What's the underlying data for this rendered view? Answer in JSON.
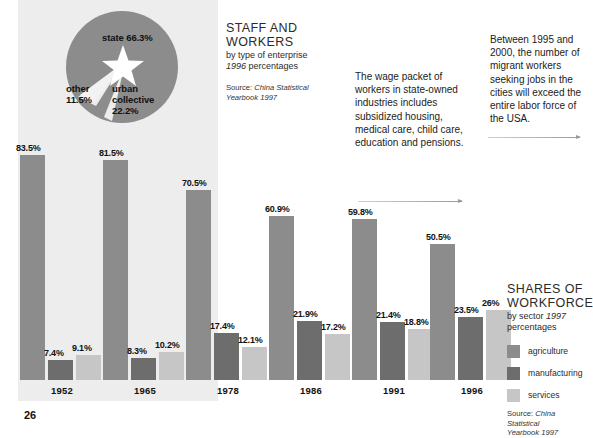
{
  "page_number": "26",
  "colors": {
    "agriculture": "#8c8c8c",
    "manufacturing": "#6d6d6d",
    "services": "#c6c6c6",
    "panel_background": "#ecedec",
    "page_background": "#ffffff"
  },
  "pie": {
    "title": "STAFF AND WORKERS",
    "slices": [
      {
        "label": "state 66.3%",
        "name": "state",
        "value": 66.3
      },
      {
        "label": "urban collective 22.2%",
        "name": "urban collective",
        "value": 22.2
      },
      {
        "label": "other 11.5%",
        "name": "other",
        "value": 11.5
      }
    ],
    "label_state": "state 66.3%",
    "label_other": "other\n11.5%",
    "label_other_line1": "other",
    "label_other_line2": "11.5%",
    "label_urban_line1": "urban",
    "label_urban_line2": "collective",
    "label_urban_line3": "22.2%",
    "center_icon": "star-icon"
  },
  "staff_block": {
    "title_line1": "STAFF AND",
    "title_line2": "WORKERS",
    "subtitle_line1": "by type of enterprise",
    "subtitle_year": "1996",
    "subtitle_line2_rest": " percentages",
    "source_prefix": "Source: ",
    "source_italic": "China Statistical",
    "source_line2": "Yearbook 1997"
  },
  "annotations": {
    "wage": "The wage packet of workers in state-owned industries includes subsidized housing, medical care, child care, education and pensions.",
    "migrant": "Between 1995 and 2000, the number of migrant workers seeking jobs in the cities will exceed the entire labor force of the USA."
  },
  "legend_block": {
    "title_line1": "SHARES OF",
    "title_line2": "WORKFORCE",
    "subtitle_line1": "by sector ",
    "subtitle_year": "1997",
    "subtitle_line2": "percentages",
    "items": [
      {
        "key": "agriculture",
        "label": "agriculture"
      },
      {
        "key": "manufacturing",
        "label": "manufacturing"
      },
      {
        "key": "services",
        "label": "services"
      }
    ],
    "source_prefix": "Source: ",
    "source_italic": "China Statistical",
    "source_line2": "Yearbook 1997"
  },
  "chart_data": {
    "type": "bar",
    "title": "SHARES OF WORKFORCE",
    "subtitle": "by sector 1997 percentages",
    "xlabel": "",
    "ylabel": "percentages",
    "ylim": [
      0,
      100
    ],
    "grid": false,
    "legend_position": "right",
    "categories": [
      "1952",
      "1965",
      "1978",
      "1986",
      "1991",
      "1996"
    ],
    "series": [
      {
        "name": "agriculture",
        "color": "#8c8c8c",
        "values": [
          83.5,
          81.5,
          70.5,
          60.9,
          59.8,
          50.5
        ],
        "labels": [
          "83.5%",
          "81.5%",
          "70.5%",
          "60.9%",
          "59.8%",
          "50.5%"
        ]
      },
      {
        "name": "manufacturing",
        "color": "#6d6d6d",
        "values": [
          7.4,
          8.3,
          17.4,
          21.9,
          21.4,
          23.5
        ],
        "labels": [
          "7.4%",
          "8.3%",
          "17.4%",
          "21.9%",
          "21.4%",
          "23.5%"
        ]
      },
      {
        "name": "services",
        "color": "#c6c6c6",
        "values": [
          9.1,
          10.2,
          12.1,
          17.2,
          18.8,
          26.0
        ],
        "labels": [
          "9.1%",
          "10.2%",
          "12.1%",
          "17.2%",
          "18.8%",
          "26%"
        ]
      }
    ],
    "pie_inset": {
      "type": "pie",
      "title": "STAFF AND WORKERS by type of enterprise 1996 percentages",
      "categories": [
        "state",
        "urban collective",
        "other"
      ],
      "values": [
        66.3,
        22.2,
        11.5
      ]
    }
  }
}
